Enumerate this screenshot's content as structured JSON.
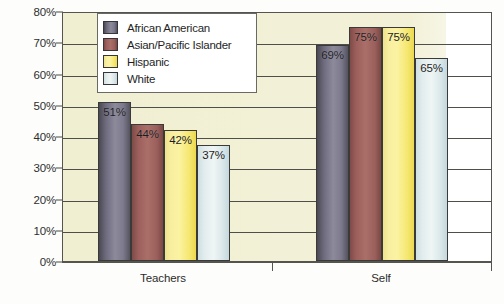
{
  "chart_data": {
    "type": "bar",
    "title": "",
    "subtitle": "",
    "xlabel": "",
    "ylabel": "",
    "categories": [
      "Teachers",
      "Self"
    ],
    "series": [
      {
        "name": "African American",
        "color": "#8d8a9c",
        "values": [
          51,
          69
        ],
        "labels": [
          "51%",
          "69%"
        ]
      },
      {
        "name": "Asian/Pacific Islander",
        "color": "#ab6f6a",
        "values": [
          44,
          75
        ],
        "labels": [
          "44%",
          "75%"
        ]
      },
      {
        "name": "Hispanic",
        "color": "#fbf3a3",
        "values": [
          42,
          75
        ],
        "labels": [
          "42%",
          "75%"
        ]
      },
      {
        "name": "White",
        "color": "#eff5f5",
        "values": [
          37,
          65
        ],
        "labels": [
          "37%",
          "65%"
        ]
      }
    ],
    "ylim": [
      0,
      80
    ],
    "ytick_labels": [
      "0%",
      "10%",
      "20%",
      "30%",
      "40%",
      "50%",
      "60%",
      "70%",
      "80%"
    ],
    "ytick_values": [
      0,
      10,
      20,
      30,
      40,
      50,
      60,
      70,
      80
    ],
    "grid": "horizontal",
    "legend_position": "top-left-inside",
    "plot_background": "#f2f0d6",
    "axis_color": "#55554f",
    "value_labels_inside_bars": true
  },
  "legend": {
    "items": [
      {
        "label": "African American"
      },
      {
        "label": "Asian/Pacific Islander"
      },
      {
        "label": "Hispanic"
      },
      {
        "label": "White"
      }
    ]
  },
  "caption": ""
}
